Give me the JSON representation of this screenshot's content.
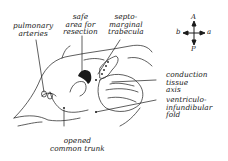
{
  "figure": {
    "labels": {
      "pulmonary_arteries": "pulmonary\narteries",
      "safe_area": "safe\narea for\nresection",
      "septomarginal": "septo-\nmarginal\ntrabecula",
      "conduction": "conduction\ntissue\naxis",
      "ventriculo": "ventriculo-\ninfundibular\nfold",
      "common_trunk": "opened\ncommon trunk"
    },
    "orientation": {
      "top": "A",
      "bottom": "P",
      "left": "b",
      "right": "a"
    },
    "colors": {
      "ink": "#1a1a1a",
      "background": "#ffffff"
    }
  }
}
